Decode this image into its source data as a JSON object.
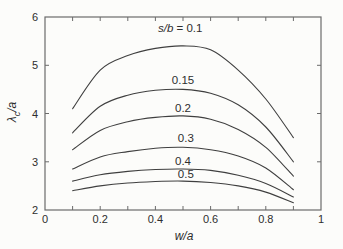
{
  "chart_data": {
    "type": "line",
    "title": "",
    "xlabel": "w/a",
    "ylabel": "λc/a",
    "ylabel_parts": {
      "symbol": "λ",
      "subscript": "c",
      "suffix": "/a"
    },
    "xlim": [
      0,
      1
    ],
    "ylim": [
      2,
      6
    ],
    "grid": false,
    "legend_position": "inline-labels",
    "x_tick_labels": [
      "0",
      "0.2",
      "0.4",
      "0.6",
      "0.8",
      "1"
    ],
    "x_tick_values": [
      0,
      0.2,
      0.4,
      0.6,
      0.8,
      1
    ],
    "x_minor_tick_values": [
      0.1,
      0.2,
      0.3,
      0.4,
      0.5,
      0.6,
      0.7,
      0.8,
      0.9
    ],
    "y_tick_labels": [
      "2",
      "3",
      "4",
      "5",
      "6"
    ],
    "y_tick_values": [
      2,
      3,
      4,
      5,
      6
    ],
    "y_inner_tick_values": [
      3,
      4,
      5
    ],
    "x": [
      0.1,
      0.2,
      0.3,
      0.4,
      0.5,
      0.6,
      0.7,
      0.8,
      0.9
    ],
    "series": [
      {
        "name": "s/b = 0.1",
        "name_italic": "s/b",
        "name_plain": " = 0.1",
        "values": [
          4.1,
          4.9,
          5.2,
          5.35,
          5.4,
          5.32,
          4.9,
          4.3,
          3.5
        ],
        "label_x": 0.49,
        "label_y": 5.77
      },
      {
        "name": "0.15",
        "name_italic": "",
        "name_plain": "0.15",
        "values": [
          3.6,
          4.15,
          4.38,
          4.48,
          4.5,
          4.42,
          4.18,
          3.72,
          3.0
        ],
        "label_x": 0.5,
        "label_y": 4.7
      },
      {
        "name": "0.2",
        "name_italic": "",
        "name_plain": "0.2",
        "values": [
          3.25,
          3.65,
          3.83,
          3.92,
          3.95,
          3.88,
          3.67,
          3.3,
          2.7
        ],
        "label_x": 0.5,
        "label_y": 4.12
      },
      {
        "name": "0.3",
        "name_italic": "",
        "name_plain": "0.3",
        "values": [
          2.85,
          3.1,
          3.21,
          3.28,
          3.3,
          3.25,
          3.12,
          2.87,
          2.42
        ],
        "label_x": 0.51,
        "label_y": 3.5
      },
      {
        "name": "0.4",
        "name_italic": "",
        "name_plain": "0.4",
        "values": [
          2.6,
          2.73,
          2.8,
          2.84,
          2.85,
          2.82,
          2.72,
          2.55,
          2.27
        ],
        "label_x": 0.5,
        "label_y": 3.02
      },
      {
        "name": "0.5",
        "name_italic": "",
        "name_plain": "0.5",
        "values": [
          2.4,
          2.5,
          2.56,
          2.59,
          2.6,
          2.57,
          2.5,
          2.37,
          2.15
        ],
        "label_x": 0.51,
        "label_y": 2.74
      }
    ],
    "line_color": "#3f3f3f",
    "axis_color": "#6b6b6b",
    "text_color": "#2e2e2e",
    "background": "#fcfcfa"
  }
}
